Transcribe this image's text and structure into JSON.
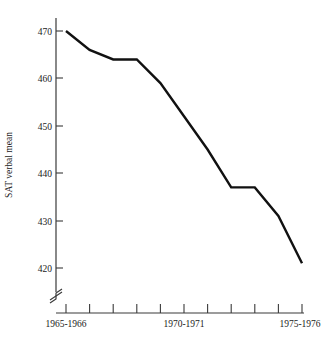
{
  "chart_data": {
    "type": "line",
    "title": "",
    "xlabel": "",
    "ylabel": "SAT verbal mean",
    "ylim": [
      415,
      473
    ],
    "yticks": [
      420,
      430,
      440,
      450,
      460,
      470
    ],
    "ytick_labels": [
      "420",
      "430",
      "440",
      "450",
      "460",
      "470"
    ],
    "grid": false,
    "legend": "none",
    "y_axis_broken": true,
    "x": [
      "1965-1966",
      "1966-1967",
      "1967-1968",
      "1968-1969",
      "1969-1970",
      "1970-1971",
      "1971-1972",
      "1972-1973",
      "1973-1974",
      "1974-1975",
      "1975-1976"
    ],
    "xtick_labels_shown": [
      "1965-1966",
      "1970-1971",
      "1975-1976"
    ],
    "xtick_label_indices": [
      0,
      5,
      10
    ],
    "series": [
      {
        "name": "SAT verbal mean",
        "color": "#111111",
        "values": [
          470,
          466,
          464,
          464,
          459,
          452,
          445,
          437,
          437,
          431,
          421
        ]
      }
    ]
  },
  "axis": {
    "y_title": "SAT verbal mean",
    "tick_count_x": 11
  }
}
